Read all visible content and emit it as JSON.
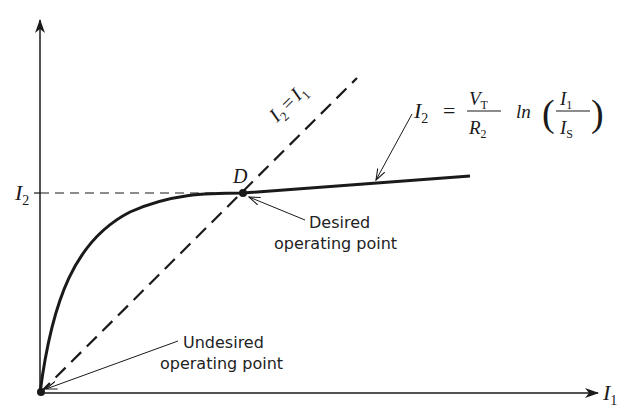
{
  "axes": {
    "x_label": "I",
    "x_label_sub": "1",
    "y_tick_label": "I",
    "y_tick_label_sub": "2"
  },
  "lines": {
    "identity_label_lhs": "I",
    "identity_label_lhs_sub": "2",
    "identity_label_eq": "=",
    "identity_label_rhs": "I",
    "identity_label_rhs_sub": "1"
  },
  "equation": {
    "lhs": "I",
    "lhs_sub": "2",
    "eq": "=",
    "num": "V",
    "num_sub": "T",
    "den": "R",
    "den_sub": "2",
    "func": "ln",
    "frac_num": "I",
    "frac_num_sub": "1",
    "frac_den": "I",
    "frac_den_sub": "S"
  },
  "points": {
    "D_label": "D"
  },
  "annotations": {
    "desired_line1": "Desired",
    "desired_line2": "operating point",
    "undesired_line1": "Undesired",
    "undesired_line2": "operating point"
  },
  "colors": {
    "ink": "#1a1a1a",
    "background": "#ffffff"
  }
}
